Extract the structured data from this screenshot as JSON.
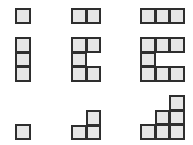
{
  "diagram": {
    "cell_size": 14.5,
    "colors": {
      "fill": "#e6e6e6",
      "border": "#2e2e2e",
      "background": "#ffffff"
    },
    "figures": [
      {
        "id": "row1-col1",
        "x": 15,
        "y": 8,
        "cells": [
          [
            0,
            0
          ]
        ]
      },
      {
        "id": "row1-col2",
        "x": 71,
        "y": 8,
        "cells": [
          [
            0,
            0
          ],
          [
            1,
            0
          ]
        ]
      },
      {
        "id": "row1-col3",
        "x": 140,
        "y": 8,
        "cells": [
          [
            0,
            0
          ],
          [
            1,
            0
          ],
          [
            2,
            0
          ]
        ]
      },
      {
        "id": "row2-col1",
        "x": 15,
        "y": 37,
        "cells": [
          [
            0,
            0
          ],
          [
            0,
            1
          ],
          [
            0,
            2
          ]
        ]
      },
      {
        "id": "row2-col2",
        "x": 71,
        "y": 37,
        "cells": [
          [
            0,
            0
          ],
          [
            1,
            0
          ],
          [
            0,
            1
          ],
          [
            0,
            2
          ],
          [
            1,
            2
          ]
        ]
      },
      {
        "id": "row2-col3",
        "x": 140,
        "y": 37,
        "cells": [
          [
            0,
            0
          ],
          [
            1,
            0
          ],
          [
            2,
            0
          ],
          [
            0,
            1
          ],
          [
            0,
            2
          ],
          [
            1,
            2
          ],
          [
            2,
            2
          ]
        ]
      },
      {
        "id": "row3-col1",
        "x": 15,
        "y": 124,
        "cells": [
          [
            0,
            0
          ]
        ]
      },
      {
        "id": "row3-col2",
        "x": 71,
        "y": 110,
        "cells": [
          [
            1,
            0
          ],
          [
            0,
            1
          ],
          [
            1,
            1
          ]
        ]
      },
      {
        "id": "row3-col3",
        "x": 140,
        "y": 95,
        "cells": [
          [
            2,
            0
          ],
          [
            1,
            1
          ],
          [
            2,
            1
          ],
          [
            0,
            2
          ],
          [
            1,
            2
          ],
          [
            2,
            2
          ]
        ]
      }
    ]
  }
}
